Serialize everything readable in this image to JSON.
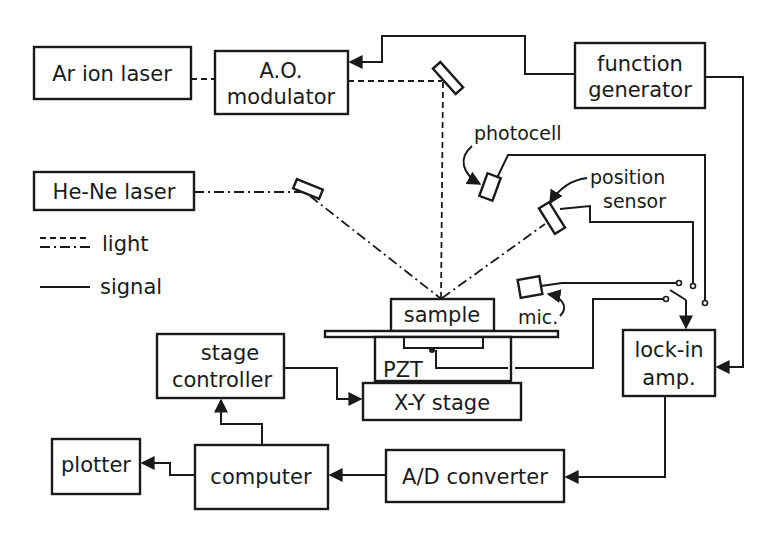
{
  "diagram": {
    "type": "block-diagram",
    "colors": {
      "ink": "#1a1a1a",
      "background": "#ffffff"
    },
    "blocks": {
      "ar_laser": {
        "label": "Ar ion laser"
      },
      "ao_modulator": {
        "line1": "A.O.",
        "line2": "modulator"
      },
      "function_generator": {
        "line1": "function",
        "line2": "generator"
      },
      "hene_laser": {
        "label": "He-Ne laser"
      },
      "sample": {
        "label": "sample"
      },
      "pzt": {
        "label": "PZT"
      },
      "xy_stage": {
        "label": "X-Y stage"
      },
      "stage_controller": {
        "line1": "stage",
        "line2": "controller"
      },
      "lockin_amp": {
        "line1": "lock-in",
        "line2": "amp."
      },
      "computer": {
        "label": "computer"
      },
      "plotter": {
        "label": "plotter"
      },
      "ad_converter": {
        "label": "A/D converter"
      }
    },
    "sensors": {
      "photocell": {
        "label": "photocell"
      },
      "position_sensor": {
        "line1": "position",
        "line2": "sensor"
      },
      "mic": {
        "label": "mic."
      }
    },
    "legend": {
      "light": "light",
      "signal": "signal"
    }
  }
}
